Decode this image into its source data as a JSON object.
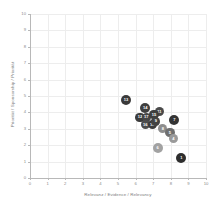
{
  "chart_data": {
    "type": "scatter",
    "title": "",
    "xlabel": "Relevanz / Evidence / Relevancy",
    "ylabel": "Priorität / Sponsorship / Priorität",
    "xlim": [
      0,
      10
    ],
    "ylim": [
      0,
      10
    ],
    "grid": true,
    "legend": "none",
    "xticks": [
      "0",
      "1",
      "2",
      "3",
      "4",
      "5",
      "6",
      "7",
      "8",
      "9",
      "10"
    ],
    "yticks": [
      "0",
      "1",
      "2",
      "3",
      "4",
      "5",
      "6",
      "7",
      "8",
      "9",
      "10"
    ],
    "points": [
      {
        "label": "13",
        "x": 5.45,
        "y": 4.75,
        "color": "#3a3a3a",
        "r": 5.0
      },
      {
        "label": "14",
        "x": 6.55,
        "y": 4.25,
        "color": "#3f3f3f",
        "r": 5.0
      },
      {
        "label": "11",
        "x": 7.35,
        "y": 4.05,
        "color": "#4a4a4a",
        "r": 4.8
      },
      {
        "label": "12",
        "x": 6.25,
        "y": 3.7,
        "color": "#3c3c3c",
        "r": 4.8
      },
      {
        "label": "17",
        "x": 6.6,
        "y": 3.7,
        "color": "#464646",
        "r": 4.6
      },
      {
        "label": "15",
        "x": 7.05,
        "y": 3.85,
        "color": "#3e3e3e",
        "r": 4.6
      },
      {
        "label": "7",
        "x": 8.2,
        "y": 3.55,
        "color": "#343434",
        "r": 5.0
      },
      {
        "label": "16",
        "x": 6.55,
        "y": 3.25,
        "color": "#4d4d4d",
        "r": 4.6
      },
      {
        "label": "10",
        "x": 6.95,
        "y": 3.25,
        "color": "#3b3b3b",
        "r": 4.6
      },
      {
        "label": "9",
        "x": 7.15,
        "y": 3.45,
        "color": "#424242",
        "r": 4.4
      },
      {
        "label": "8",
        "x": 7.55,
        "y": 3.0,
        "color": "#8e8e8e",
        "r": 4.6
      },
      {
        "label": "5",
        "x": 7.95,
        "y": 2.75,
        "color": "#6f6f6f",
        "r": 4.6
      },
      {
        "label": "4",
        "x": 8.15,
        "y": 2.4,
        "color": "#9a9a9a",
        "r": 4.6
      },
      {
        "label": "6",
        "x": 7.25,
        "y": 1.85,
        "color": "#a2a2a2",
        "r": 5.0
      },
      {
        "label": "1",
        "x": 8.6,
        "y": 1.2,
        "color": "#2e2e2e",
        "r": 5.0
      }
    ]
  }
}
